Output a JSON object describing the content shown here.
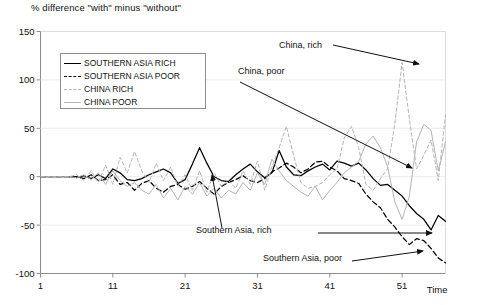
{
  "chart_data": {
    "type": "line",
    "title": "% difference \"with\" minus \"without\"",
    "xlabel": "Time",
    "ylabel": "",
    "xlim": [
      1,
      57
    ],
    "ylim": [
      -100,
      150
    ],
    "grid": false,
    "legend_position": "upper-left-inside",
    "xticks": [
      "1",
      "11",
      "21",
      "31",
      "41",
      "51"
    ],
    "xtick_values": [
      1,
      11,
      21,
      31,
      41,
      51
    ],
    "yticks": [
      "150",
      "100",
      "50",
      "0",
      "-50",
      "-100"
    ],
    "ytick_values": [
      150,
      100,
      50,
      0,
      -50,
      -100
    ],
    "x": [
      1,
      2,
      3,
      4,
      5,
      6,
      7,
      8,
      9,
      10,
      11,
      12,
      13,
      14,
      15,
      16,
      17,
      18,
      19,
      20,
      21,
      22,
      23,
      24,
      25,
      26,
      27,
      28,
      29,
      30,
      31,
      32,
      33,
      34,
      35,
      36,
      37,
      38,
      39,
      40,
      41,
      42,
      43,
      44,
      45,
      46,
      47,
      48,
      49,
      50,
      51,
      52,
      53,
      54,
      55,
      56,
      57
    ],
    "series": [
      {
        "name": "SOUTHERN ASIA RICH",
        "annotation": "Southern Asia, rich",
        "color": "#000000",
        "style": "solid",
        "values": [
          0,
          0,
          0,
          0,
          0,
          -1,
          1,
          -2,
          2,
          -2,
          8,
          4,
          -3,
          -4,
          -2,
          2,
          5,
          8,
          4,
          -7,
          -3,
          13,
          30,
          14,
          0,
          -4,
          -5,
          2,
          8,
          13,
          5,
          -1,
          4,
          27,
          10,
          2,
          1,
          6,
          10,
          13,
          7,
          16,
          14,
          11,
          14,
          7,
          -2,
          -9,
          -8,
          -14,
          -20,
          -30,
          -38,
          -44,
          -55,
          -40,
          -46
        ]
      },
      {
        "name": "SOUTHERN ASIA POOR",
        "annotation": "Southern Asia, poor",
        "color": "#000000",
        "style": "dashed",
        "values": [
          0,
          0,
          0,
          0,
          0,
          0,
          -2,
          2,
          -4,
          -3,
          2,
          -8,
          -6,
          -14,
          -7,
          -4,
          -12,
          -16,
          -10,
          -8,
          -13,
          -10,
          -5,
          -12,
          -18,
          -10,
          -6,
          -3,
          1,
          -4,
          -6,
          -2,
          5,
          9,
          14,
          10,
          4,
          8,
          15,
          16,
          10,
          6,
          -2,
          -4,
          -7,
          -18,
          -26,
          -32,
          -44,
          -52,
          -62,
          -70,
          -64,
          -66,
          -74,
          -84,
          -89
        ]
      },
      {
        "name": "CHINA RICH",
        "annotation": "China, rich",
        "color": "#b4b4b4",
        "style": "dashed",
        "values": [
          0,
          0,
          0,
          0,
          0,
          2,
          -4,
          6,
          -6,
          12,
          -8,
          20,
          4,
          26,
          6,
          -6,
          14,
          -4,
          10,
          -10,
          2,
          -14,
          6,
          -16,
          4,
          -10,
          -4,
          -12,
          6,
          -8,
          16,
          -14,
          10,
          30,
          52,
          22,
          -6,
          -12,
          -10,
          -6,
          2,
          8,
          40,
          52,
          30,
          -8,
          -14,
          -2,
          8,
          55,
          118,
          60,
          8,
          22,
          38,
          -4,
          64
        ]
      },
      {
        "name": "CHINA POOR",
        "annotation": "China, poor",
        "color": "#b4b4b4",
        "style": "solid",
        "values": [
          0,
          0,
          0,
          0,
          0,
          -1,
          2,
          -3,
          4,
          -8,
          6,
          -4,
          -10,
          -6,
          -14,
          -18,
          -8,
          -22,
          -12,
          -24,
          -10,
          -18,
          -6,
          -20,
          -12,
          -22,
          -14,
          -18,
          -6,
          -14,
          4,
          -8,
          18,
          6,
          -4,
          -10,
          -16,
          -20,
          -10,
          -24,
          -14,
          -6,
          4,
          10,
          16,
          34,
          42,
          30,
          10,
          -26,
          -44,
          -20,
          36,
          54,
          48,
          6,
          36
        ]
      }
    ],
    "annotations": [
      {
        "label": "China, rich",
        "x_px": 279,
        "y_px": 48
      },
      {
        "label": "China, poor",
        "x_px": 238,
        "y_px": 74
      },
      {
        "label": "Southern Asia, rich",
        "x_px": 196,
        "y_px": 233
      },
      {
        "label": "Southern Asia, poor",
        "x_px": 263,
        "y_px": 261
      }
    ]
  },
  "legend": {
    "items": [
      {
        "label": "SOUTHERN ASIA RICH",
        "style": "s-black-solid"
      },
      {
        "label": "SOUTHERN ASIA POOR",
        "style": "s-black-dash"
      },
      {
        "label": "CHINA RICH",
        "style": "s-gray-dash"
      },
      {
        "label": "CHINA POOR",
        "style": "s-gray-solid"
      }
    ]
  },
  "colors": {
    "series_dark": "#000000",
    "series_light": "#b4b4b4",
    "axis": "#8d8d8d",
    "text": "#111111"
  }
}
